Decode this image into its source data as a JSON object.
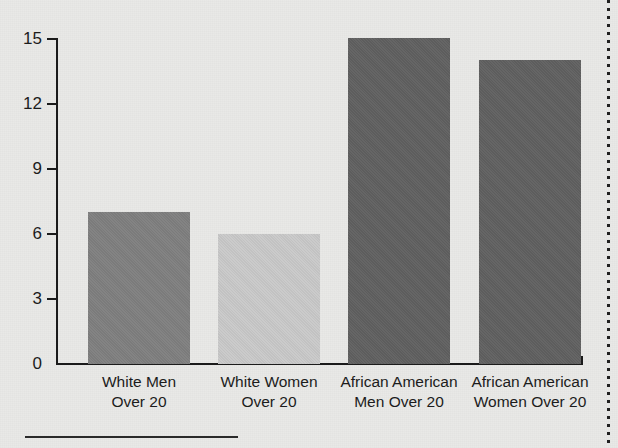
{
  "chart_data": {
    "type": "bar",
    "title": "",
    "subtitle": "",
    "xlabel": "",
    "ylabel": "",
    "categories": [
      "White Men Over 20",
      "White Women Over 20",
      "African American Men Over 20",
      "African American Women Over 20"
    ],
    "category_lines": [
      [
        "White Men",
        "Over 20"
      ],
      [
        "White Women",
        "Over 20"
      ],
      [
        "African American",
        "Men Over 20"
      ],
      [
        "African American",
        "Women Over 20"
      ]
    ],
    "values": [
      7,
      6,
      15,
      14
    ],
    "bar_colors": [
      "#7f7f7f",
      "#c9c9c9",
      "#606060",
      "#606060"
    ],
    "ylim": [
      0,
      15
    ],
    "yticks": [
      0,
      3,
      6,
      9,
      12,
      15
    ],
    "ytick_labels": [
      "0",
      "3",
      "6",
      "9",
      "12",
      "15"
    ],
    "grid": false,
    "legend": "none"
  },
  "axis": {
    "y_tick_0": "0",
    "y_tick_3": "3",
    "y_tick_6": "6",
    "y_tick_9": "9",
    "y_tick_12": "12",
    "y_tick_15": "15"
  },
  "categories": [
    {
      "line1": "White Men",
      "line2": "Over 20"
    },
    {
      "line1": "White Women",
      "line2": "Over 20"
    },
    {
      "line1": "African American",
      "line2": "Men Over 20"
    },
    {
      "line1": "African American",
      "line2": "Women Over 20"
    }
  ],
  "colors": {
    "background": "#e9e9e7",
    "axis": "#1b1b1b",
    "text": "#1c1c1c",
    "bar_white_men": "#7f7f7f",
    "bar_white_women": "#c9c9c9",
    "bar_aa_men": "#606060",
    "bar_aa_women": "#606060"
  }
}
